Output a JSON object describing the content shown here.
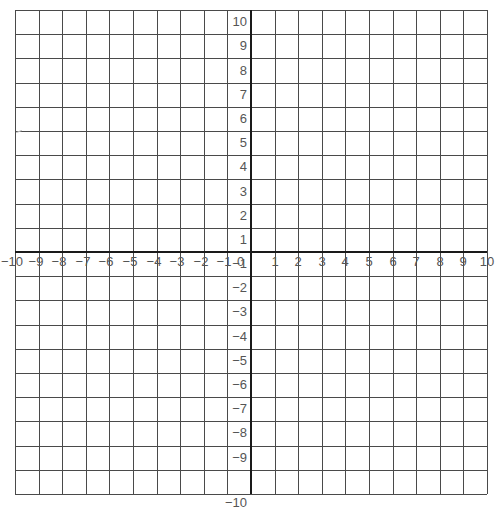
{
  "diagram": {
    "type": "coordinate-plane",
    "title": "",
    "x_axis": {
      "min": -10,
      "max": 10,
      "step": 1,
      "tick_labels": [
        "−10",
        "−9",
        "−8",
        "−7",
        "−6",
        "−5",
        "−4",
        "−3",
        "−2",
        "−1",
        "1",
        "2",
        "3",
        "4",
        "5",
        "6",
        "7",
        "8",
        "9",
        "10"
      ]
    },
    "y_axis": {
      "min": -10,
      "max": 10,
      "step": 1,
      "tick_labels_positive": [
        "10",
        "9",
        "8",
        "7",
        "6",
        "5",
        "4",
        "3",
        "2",
        "1"
      ],
      "tick_labels_negative": [
        "−1",
        "−2",
        "−3",
        "−4",
        "−5",
        "−6",
        "−7",
        "−8",
        "−9",
        "−10"
      ]
    },
    "origin_label": "0",
    "colors": {
      "grid_line": "#4a4a4a",
      "axis_line": "#1a1a1a",
      "label_text": "#555555",
      "background": "#ffffff"
    },
    "geometry": {
      "left": 15,
      "top": 10,
      "right": 487,
      "bottom": 494,
      "cols": 20,
      "rows": 20
    }
  }
}
